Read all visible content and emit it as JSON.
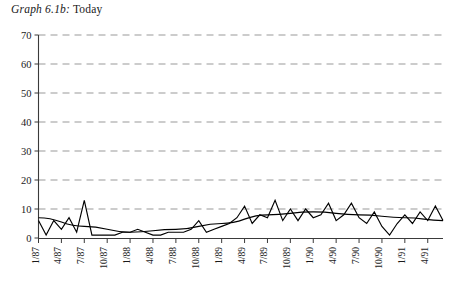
{
  "chart_data": {
    "type": "line",
    "title": "Graph 6.1b: Today",
    "title_italic_part": "Graph 6.1b:",
    "title_roman_part": "Today",
    "xlabel": "",
    "ylabel": "",
    "ylim": [
      0,
      70
    ],
    "ytick_values": [
      0,
      10,
      20,
      30,
      40,
      50,
      60,
      70
    ],
    "ytick_labels": [
      "0",
      "10",
      "20",
      "30",
      "40",
      "50",
      "60",
      "70"
    ],
    "grid": true,
    "grid_axis": "y",
    "grid_style": "dashed",
    "legend": "none",
    "xtick_labels": [
      "1/87",
      "4/87",
      "7/87",
      "10/87",
      "1/88",
      "4/88",
      "7/88",
      "10/88",
      "1/89",
      "4/89",
      "7/89",
      "10/89",
      "1/90",
      "4/90",
      "7/90",
      "10/90",
      "1/91",
      "4/91"
    ],
    "xtick_label_rotation": -90,
    "x_period": "monthly, Jan 1987 through Jun 1991",
    "series": [
      {
        "name": "Today",
        "style": "jagged monthly observations",
        "x": [
          "1/87",
          "2/87",
          "3/87",
          "4/87",
          "5/87",
          "6/87",
          "7/87",
          "8/87",
          "9/87",
          "10/87",
          "11/87",
          "12/87",
          "1/88",
          "2/88",
          "3/88",
          "4/88",
          "5/88",
          "6/88",
          "7/88",
          "8/88",
          "9/88",
          "10/88",
          "11/88",
          "12/88",
          "1/89",
          "2/89",
          "3/89",
          "4/89",
          "5/89",
          "6/89",
          "7/89",
          "8/89",
          "9/89",
          "10/89",
          "11/89",
          "12/89",
          "1/90",
          "2/90",
          "3/90",
          "4/90",
          "5/90",
          "6/90",
          "7/90",
          "8/90",
          "9/90",
          "10/90",
          "11/90",
          "12/90",
          "1/91",
          "2/91",
          "3/91",
          "4/91",
          "5/91",
          "6/91"
        ],
        "values": [
          6,
          1,
          6,
          3,
          7,
          2,
          13,
          1,
          1,
          1,
          1,
          2,
          2,
          3,
          2,
          1,
          1,
          2,
          2,
          2,
          3,
          6,
          2,
          3,
          4,
          5,
          7,
          11,
          5,
          8,
          7,
          13,
          6,
          10,
          6,
          10,
          7,
          8,
          12,
          6,
          8,
          12,
          7,
          5,
          9,
          4,
          1,
          5,
          8,
          5,
          9,
          6,
          11,
          6
        ]
      },
      {
        "name": "Trend",
        "style": "smooth trend overlay",
        "x": [
          "1/87",
          "7/87",
          "1/88",
          "7/88",
          "1/89",
          "7/89",
          "1/90",
          "7/90",
          "1/91",
          "6/91"
        ],
        "values": [
          7,
          4,
          2,
          3,
          5,
          8,
          9,
          8,
          7,
          6
        ]
      }
    ]
  }
}
